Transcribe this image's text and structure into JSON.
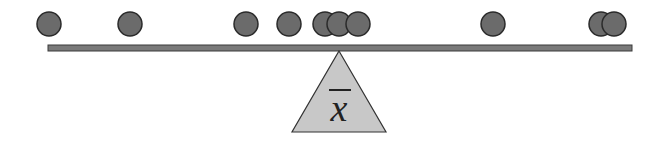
{
  "diagram": {
    "fulcrum_label": "x",
    "fulcrum_label_overline": true,
    "colors": {
      "ball_fill": "#6b6b6b",
      "ball_stroke": "#2a2a2a",
      "beam_fill": "#7a7a7a",
      "beam_stroke": "#3a3a3a",
      "fulcrum_fill": "#c8c8c8",
      "fulcrum_stroke": "#333333",
      "background": "#ffffff"
    },
    "beam": {
      "x1": 48,
      "x2": 632,
      "y": 45,
      "height": 6
    },
    "fulcrum": {
      "apex_x": 339,
      "apex_y": 51,
      "base_left_x": 292,
      "base_right_x": 386,
      "base_y": 132
    },
    "balls": [
      {
        "cx": 49
      },
      {
        "cx": 130
      },
      {
        "cx": 246
      },
      {
        "cx": 289
      },
      {
        "cx": 325
      },
      {
        "cx": 339
      },
      {
        "cx": 358
      },
      {
        "cx": 493
      },
      {
        "cx": 601
      },
      {
        "cx": 614
      }
    ],
    "ball_radius": 12,
    "ball_cy": 24
  }
}
